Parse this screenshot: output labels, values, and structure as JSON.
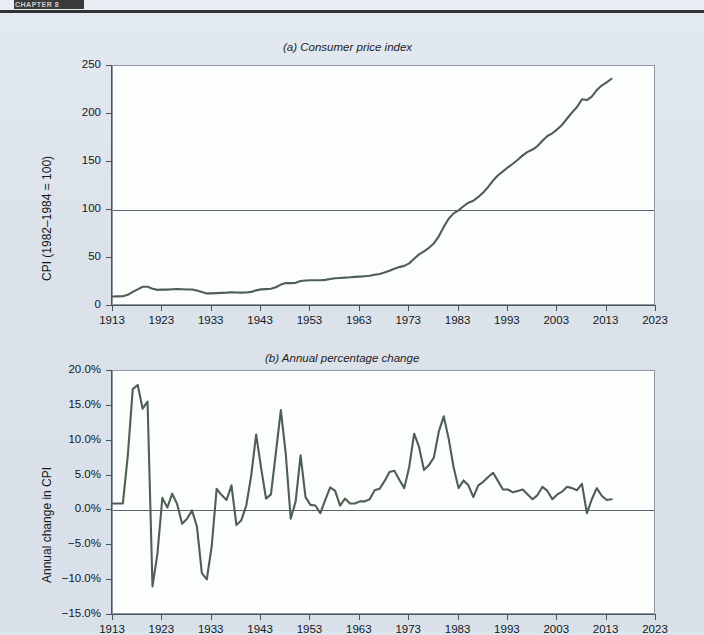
{
  "header": {
    "tag_label": "CHAPTER 8",
    "accent": "#3b3b3b"
  },
  "figure": {
    "line_color": "#4d6052",
    "plot_bg": "#fcfdfd",
    "page_bg": "#dde4ec",
    "axis_color": "#4b545d"
  },
  "chart_data": [
    {
      "type": "line",
      "panel": "a",
      "title": "(a) Consumer price index",
      "xlabel": "",
      "ylabel": "CPI (1982–1984 = 100)",
      "xlim": [
        1913,
        2023
      ],
      "ylim": [
        0,
        250
      ],
      "xticks": [
        1913,
        1923,
        1933,
        1943,
        1953,
        1963,
        1973,
        1983,
        1993,
        2003,
        2013,
        2023
      ],
      "yticks": [
        0,
        50,
        100,
        150,
        200,
        250
      ],
      "ytick_labels": [
        "0",
        "50",
        "100",
        "150",
        "200",
        "250"
      ],
      "grid": false,
      "reference_line": 100,
      "legend": "none",
      "x": [
        1913,
        1914,
        1915,
        1916,
        1917,
        1918,
        1919,
        1920,
        1921,
        1922,
        1923,
        1924,
        1925,
        1926,
        1927,
        1928,
        1929,
        1930,
        1931,
        1932,
        1933,
        1934,
        1935,
        1936,
        1937,
        1938,
        1939,
        1940,
        1941,
        1942,
        1943,
        1944,
        1945,
        1946,
        1947,
        1948,
        1949,
        1950,
        1951,
        1952,
        1953,
        1954,
        1955,
        1956,
        1957,
        1958,
        1959,
        1960,
        1961,
        1962,
        1963,
        1964,
        1965,
        1966,
        1967,
        1968,
        1969,
        1970,
        1971,
        1972,
        1973,
        1974,
        1975,
        1976,
        1977,
        1978,
        1979,
        1980,
        1981,
        1982,
        1983,
        1984,
        1985,
        1986,
        1987,
        1988,
        1989,
        1990,
        1991,
        1992,
        1993,
        1994,
        1995,
        1996,
        1997,
        1998,
        1999,
        2000,
        2001,
        2002,
        2003,
        2004,
        2005,
        2006,
        2007,
        2008,
        2009,
        2010,
        2011,
        2012,
        2013,
        2014
      ],
      "values": [
        9.9,
        10.0,
        10.1,
        11.6,
        14.7,
        17.3,
        20.0,
        20.0,
        17.9,
        16.8,
        17.1,
        17.1,
        17.5,
        17.7,
        17.4,
        17.2,
        17.2,
        16.1,
        14.6,
        13.1,
        13.2,
        13.4,
        13.7,
        13.9,
        14.4,
        14.1,
        13.9,
        14.0,
        14.7,
        16.3,
        17.3,
        17.6,
        18.0,
        19.5,
        22.3,
        24.0,
        23.8,
        24.1,
        26.0,
        26.6,
        26.8,
        26.9,
        26.8,
        27.2,
        28.1,
        28.9,
        29.2,
        29.6,
        29.9,
        30.3,
        30.6,
        31.0,
        31.5,
        32.5,
        33.4,
        34.8,
        36.7,
        38.8,
        40.5,
        41.8,
        44.4,
        49.3,
        53.8,
        56.9,
        60.6,
        65.2,
        72.6,
        82.4,
        90.9,
        96.5,
        99.6,
        103.9,
        107.6,
        109.6,
        113.6,
        118.3,
        124.0,
        130.7,
        136.2,
        140.3,
        144.5,
        148.2,
        152.4,
        156.9,
        160.5,
        163.0,
        166.6,
        172.2,
        177.1,
        179.9,
        184.0,
        188.9,
        195.3,
        201.6,
        207.3,
        215.3,
        214.5,
        218.1,
        224.9,
        229.6,
        233.0,
        236.7
      ]
    },
    {
      "type": "line",
      "panel": "b",
      "title": "(b) Annual percentage change",
      "xlabel": "",
      "ylabel": "Annual change in CPI",
      "xlim": [
        1913,
        2023
      ],
      "ylim": [
        -15.0,
        20.0
      ],
      "xticks": [
        1913,
        1923,
        1933,
        1943,
        1953,
        1963,
        1973,
        1983,
        1993,
        2003,
        2013,
        2023
      ],
      "yticks": [
        -15.0,
        -10.0,
        -5.0,
        0.0,
        5.0,
        10.0,
        15.0,
        20.0
      ],
      "ytick_labels": [
        "−15.0%",
        "−10.0%",
        "−5.0%",
        "0.0%",
        "5.0%",
        "10.0%",
        "15.0%",
        "20.0%"
      ],
      "grid": false,
      "reference_line": 0,
      "legend": "none",
      "x": [
        1913,
        1914,
        1915,
        1916,
        1917,
        1918,
        1919,
        1920,
        1921,
        1922,
        1923,
        1924,
        1925,
        1926,
        1927,
        1928,
        1929,
        1930,
        1931,
        1932,
        1933,
        1934,
        1935,
        1936,
        1937,
        1938,
        1939,
        1940,
        1941,
        1942,
        1943,
        1944,
        1945,
        1946,
        1947,
        1948,
        1949,
        1950,
        1951,
        1952,
        1953,
        1954,
        1955,
        1956,
        1957,
        1958,
        1959,
        1960,
        1961,
        1962,
        1963,
        1964,
        1965,
        1966,
        1967,
        1968,
        1969,
        1970,
        1971,
        1972,
        1973,
        1974,
        1975,
        1976,
        1977,
        1978,
        1979,
        1980,
        1981,
        1982,
        1983,
        1984,
        1985,
        1986,
        1987,
        1988,
        1989,
        1990,
        1991,
        1992,
        1993,
        1994,
        1995,
        1996,
        1997,
        1998,
        1999,
        2000,
        2001,
        2002,
        2003,
        2004,
        2005,
        2006,
        2007,
        2008,
        2009,
        2010,
        2011,
        2012,
        2013,
        2014
      ],
      "values": [
        1.0,
        1.0,
        1.0,
        7.9,
        17.4,
        18.0,
        14.6,
        15.6,
        -10.9,
        -6.2,
        1.8,
        0.4,
        2.4,
        0.9,
        -1.9,
        -1.2,
        0.0,
        -2.3,
        -9.0,
        -9.9,
        -5.1,
        3.1,
        2.2,
        1.5,
        3.6,
        -2.1,
        -1.4,
        0.7,
        5.0,
        10.9,
        6.1,
        1.7,
        2.3,
        8.3,
        14.4,
        8.1,
        -1.2,
        1.3,
        7.9,
        1.9,
        0.8,
        0.7,
        -0.4,
        1.5,
        3.3,
        2.8,
        0.7,
        1.7,
        1.0,
        1.0,
        1.3,
        1.3,
        1.6,
        2.9,
        3.1,
        4.2,
        5.5,
        5.7,
        4.4,
        3.2,
        6.2,
        11.0,
        9.1,
        5.8,
        6.5,
        7.6,
        11.3,
        13.5,
        10.3,
        6.2,
        3.2,
        4.3,
        3.6,
        1.9,
        3.6,
        4.1,
        4.8,
        5.4,
        4.2,
        3.0,
        3.0,
        2.6,
        2.8,
        3.0,
        2.3,
        1.6,
        2.2,
        3.4,
        2.8,
        1.6,
        2.3,
        2.7,
        3.4,
        3.2,
        2.9,
        3.8,
        -0.4,
        1.6,
        3.2,
        2.1,
        1.5,
        1.6
      ]
    }
  ]
}
